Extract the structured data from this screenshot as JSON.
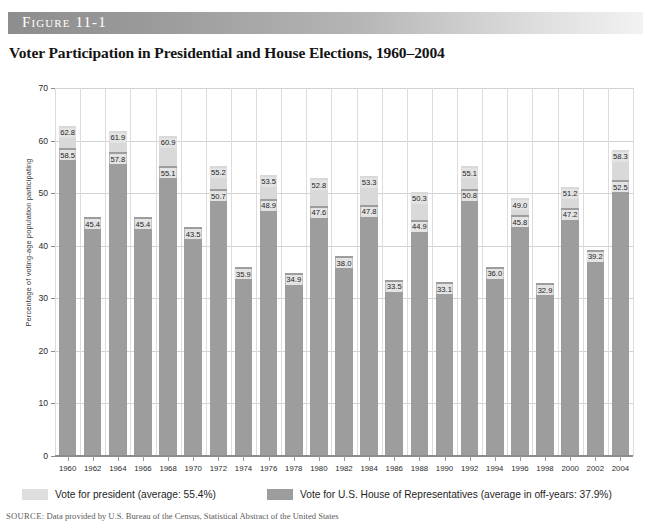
{
  "figure": {
    "label": "Figure 11-1",
    "title": "Voter Participation in Presidential and House Elections, 1960–2004",
    "source_label": "SOURCE:",
    "source_text": "Data provided by U.S. Bureau of the Census, Statistical Abstract of the United States"
  },
  "legend": {
    "president": {
      "label": "Vote for president (average: 55.4%)",
      "color": "#dedede",
      "swatch_name": "legend-swatch-president"
    },
    "house": {
      "label": "Vote for U.S. House of Representatives (average in off-years: 37.9%)",
      "color": "#9d9d9d",
      "swatch_name": "legend-swatch-house"
    }
  },
  "chart_data": {
    "type": "bar",
    "title": "Voter Participation in Presidential and House Elections, 1960–2004",
    "xlabel": "",
    "ylabel": "Percentage of voting-age population participating",
    "ylim": [
      0,
      70
    ],
    "yticks": [
      0,
      10,
      20,
      30,
      40,
      50,
      60,
      70
    ],
    "grid": true,
    "legend_position": "bottom",
    "stacked": true,
    "categories": [
      "1960",
      "1962",
      "1964",
      "1966",
      "1968",
      "1970",
      "1972",
      "1974",
      "1976",
      "1978",
      "1980",
      "1982",
      "1984",
      "1986",
      "1988",
      "1990",
      "1992",
      "1994",
      "1996",
      "1998",
      "2000",
      "2002",
      "2004"
    ],
    "series": [
      {
        "name": "Vote for president (average: 55.4%)",
        "color": "#d9d9d9",
        "values": [
          62.8,
          null,
          61.9,
          null,
          60.9,
          null,
          55.2,
          null,
          53.5,
          null,
          52.8,
          null,
          53.3,
          null,
          50.3,
          null,
          55.1,
          null,
          49.0,
          null,
          51.2,
          null,
          58.3
        ]
      },
      {
        "name": "Vote for U.S. House of Representatives (average in off-years: 37.9%)",
        "color": "#9d9d9d",
        "values": [
          58.5,
          45.4,
          57.8,
          45.4,
          55.1,
          43.5,
          50.7,
          35.9,
          48.9,
          34.9,
          47.6,
          38.0,
          47.8,
          33.5,
          44.9,
          33.1,
          50.8,
          36.0,
          45.8,
          32.9,
          47.2,
          39.2,
          52.5
        ]
      }
    ],
    "averages": {
      "president_average": 55.4,
      "house_offyear_average": 37.9
    }
  }
}
